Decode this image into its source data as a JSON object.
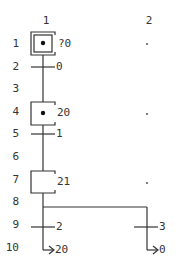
{
  "columns": [
    {
      "label": "1",
      "x": 46
    },
    {
      "label": "2",
      "x": 149
    }
  ],
  "rows": [
    {
      "label": "1",
      "y": 44
    },
    {
      "label": "2",
      "y": 67
    },
    {
      "label": "3",
      "y": 89
    },
    {
      "label": "4",
      "y": 112
    },
    {
      "label": "5",
      "y": 134
    },
    {
      "label": "6",
      "y": 157
    },
    {
      "label": "7",
      "y": 180
    },
    {
      "label": "8",
      "y": 202
    },
    {
      "label": "9",
      "y": 225
    },
    {
      "label": "10",
      "y": 248
    }
  ],
  "steps": [
    {
      "row": 1,
      "col": 1,
      "kind": "initial",
      "active": true,
      "label": "?0"
    },
    {
      "row": 4,
      "col": 1,
      "kind": "step",
      "active": true,
      "label": "20"
    },
    {
      "row": 7,
      "col": 1,
      "kind": "step",
      "active": false,
      "label": "21"
    }
  ],
  "transitions": [
    {
      "row": 2,
      "col": 1,
      "label": "0"
    },
    {
      "row": 5,
      "col": 1,
      "label": "1"
    },
    {
      "row": 9,
      "col": 1,
      "label": "2"
    },
    {
      "row": 9,
      "col": 2,
      "label": "3"
    }
  ],
  "jumps": [
    {
      "row": 10,
      "col": 1,
      "target": "20"
    },
    {
      "row": 10,
      "col": 2,
      "target": "0"
    }
  ],
  "empty_markers": [
    {
      "row": 1,
      "col": 2
    },
    {
      "row": 4,
      "col": 2
    },
    {
      "row": 7,
      "col": 2
    }
  ],
  "labels": {
    "col1": "1",
    "col2": "2",
    "step1": "?0",
    "step4": "20",
    "step7": "21",
    "trans2": "0",
    "trans5": "1",
    "trans9a": "2",
    "trans9b": "3",
    "jump10a": "20",
    "jump10b": "0"
  },
  "colors": {
    "line": "#333333",
    "text": "#333333",
    "background": "#ffffff"
  }
}
